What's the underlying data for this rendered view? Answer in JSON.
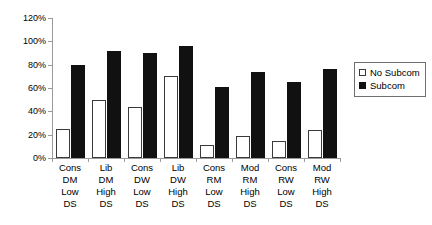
{
  "chart_data": {
    "type": "bar",
    "title": "",
    "xlabel": "",
    "ylabel": "",
    "ylim": [
      0,
      120
    ],
    "ytick_labels": [
      "0%",
      "20%",
      "40%",
      "60%",
      "80%",
      "100%",
      "120%"
    ],
    "ytick_values": [
      0,
      20,
      40,
      60,
      80,
      100,
      120
    ],
    "grid": false,
    "legend_position": "right",
    "categories": [
      "Cons DM Low DS",
      "Lib DM High DS",
      "Cons DW Low DS",
      "Lib DW High DS",
      "Cons RM Low DS",
      "Mod RM High DS",
      "Cons RW Low DS",
      "Mod RW High DS"
    ],
    "category_lines": [
      [
        "Cons",
        "DM",
        "Low",
        "DS"
      ],
      [
        "Lib",
        "DM",
        "High",
        "DS"
      ],
      [
        "Cons",
        "DW",
        "Low",
        "DS"
      ],
      [
        "Lib",
        "DW",
        "High",
        "DS"
      ],
      [
        "Cons",
        "RM",
        "Low",
        "DS"
      ],
      [
        "Mod",
        "RM",
        "High",
        "DS"
      ],
      [
        "Cons",
        "RW",
        "Low",
        "DS"
      ],
      [
        "Mod",
        "RW",
        "High",
        "DS"
      ]
    ],
    "series": [
      {
        "name": "No Subcom",
        "color": "#ffffff",
        "values": [
          25,
          50,
          44,
          70,
          11,
          19,
          15,
          24
        ]
      },
      {
        "name": "Subcom",
        "color": "#111111",
        "values": [
          80,
          92,
          90,
          96,
          61,
          74,
          65,
          76
        ]
      }
    ]
  },
  "legend": {
    "items": [
      {
        "label": "No Subcom",
        "swatch": "white-square-swatch"
      },
      {
        "label": "Subcom",
        "swatch": "black-square-swatch"
      }
    ]
  }
}
